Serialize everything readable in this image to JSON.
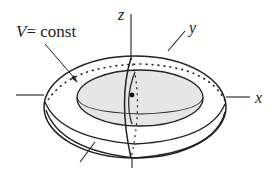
{
  "diagram": {
    "labels": {
      "surface": "V= const",
      "surface_var": "V",
      "surface_rest": "= const",
      "z_axis": "z",
      "y_axis": "y",
      "x_axis": "x"
    },
    "colors": {
      "stroke": "#222222",
      "inner_fill": "#e6e6e6",
      "background": "#ffffff"
    }
  }
}
